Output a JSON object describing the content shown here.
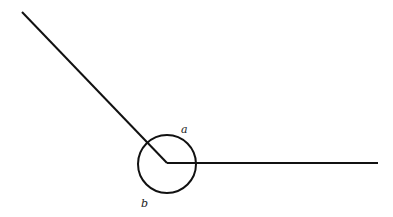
{
  "diagram": {
    "stroke_color": "#111111",
    "background": "#ffffff",
    "vertex": {
      "x": 167,
      "y": 163
    },
    "ray_left_end": {
      "x": 22,
      "y": 12
    },
    "ray_right_end": {
      "x": 378,
      "y": 163
    },
    "circle": {
      "cx": 167,
      "cy": 164,
      "r": 29
    },
    "labels": {
      "a": {
        "text": "a",
        "x": 181,
        "y": 133
      },
      "b": {
        "text": "b",
        "x": 141,
        "y": 207
      }
    }
  }
}
